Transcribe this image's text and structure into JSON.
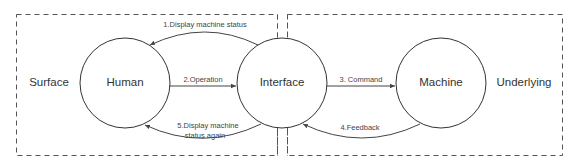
{
  "regions": {
    "surface": {
      "label": "Surface"
    },
    "underlying": {
      "label": "Underlying"
    }
  },
  "nodes": {
    "human": {
      "label": "Human"
    },
    "interface": {
      "label": "Interface"
    },
    "machine": {
      "label": "Machine"
    }
  },
  "edges": {
    "display_status": {
      "label": "1.Display machine status",
      "from": "Interface",
      "to": "Human"
    },
    "operation": {
      "label": "2.Operation",
      "from": "Human",
      "to": "Interface"
    },
    "command": {
      "label": "3. Command",
      "from": "Interface",
      "to": "Machine"
    },
    "feedback": {
      "label": "4.Feedback",
      "from": "Machine",
      "to": "Interface"
    },
    "display_status_again": {
      "label_line1": "5.Display machine",
      "label_line2": "status again",
      "from": "Interface",
      "to": "Human"
    }
  },
  "colors": {
    "stroke": "#444444",
    "text": "#333333",
    "background": "#ffffff"
  }
}
